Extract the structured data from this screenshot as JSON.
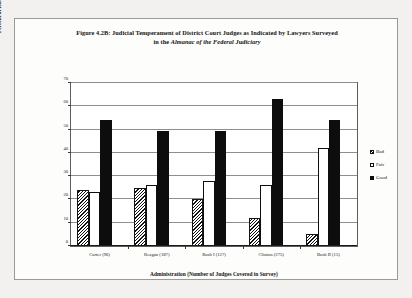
{
  "figure": {
    "title_line1": "Figure 4.2B: Judicial Temperament of District Court Judges as Indicated by Lawyers Surveyed",
    "title_line2_prefix": "in the ",
    "title_line2_italic": "Almanac of the Federal Judiciary"
  },
  "legend": {
    "items": [
      {
        "label": "Bad",
        "swatch": "hatched-diagonal",
        "color": "#111111"
      },
      {
        "label": "Fair",
        "swatch": "open-white",
        "color": "#ffffff"
      },
      {
        "label": "Good",
        "swatch": "solid-black",
        "color": "#0d0d0d"
      }
    ]
  },
  "chart_data": {
    "type": "bar",
    "title": "Figure 4.2B: Judicial Temperament of District Court Judges as Indicated by Lawyers Surveyed in the Almanac of the Federal Judiciary",
    "xlabel": "Administration (Number of Judges Covered in Survey)",
    "ylabel": "Percent of Lawyers Surveyed Who Rated Nominee",
    "categories": [
      "Carter (96)",
      "Reagan (187)",
      "Bush I (127)",
      "Clinton (275)",
      "Bush II (15)"
    ],
    "series": [
      {
        "name": "Bad",
        "values": [
          24,
          25,
          20,
          12,
          5
        ]
      },
      {
        "name": "Fair",
        "values": [
          23,
          26,
          28,
          26,
          42
        ]
      },
      {
        "name": "Good",
        "values": [
          54,
          49.5,
          49.5,
          63,
          54
        ]
      }
    ],
    "ylim": [
      0,
      70
    ],
    "yticks": [
      0,
      10,
      20,
      30,
      40,
      50,
      60,
      70
    ],
    "ytick_labels": [
      "0",
      "10",
      "20",
      "30",
      "40",
      "50",
      "60",
      "70"
    ],
    "grid": true,
    "grid_axis": "y",
    "legend_position": "right"
  }
}
